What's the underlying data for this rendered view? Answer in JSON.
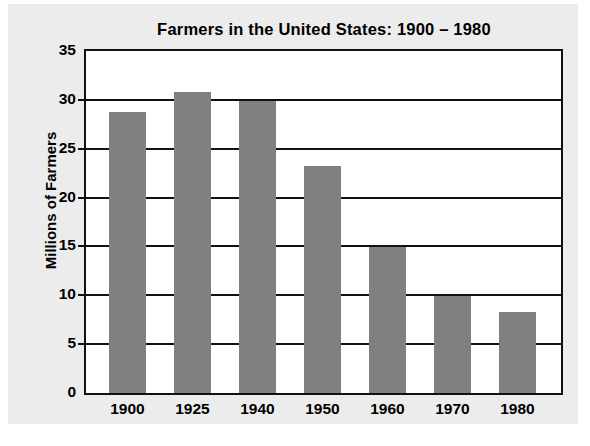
{
  "chart_data": {
    "type": "bar",
    "title": "Farmers in the United States: 1900 – 1980",
    "xlabel": "",
    "ylabel": "Millions of Farmers",
    "categories": [
      "1900",
      "1925",
      "1940",
      "1950",
      "1960",
      "1970",
      "1980"
    ],
    "values": [
      28.8,
      30.8,
      29.9,
      23.2,
      14.9,
      9.9,
      8.3
    ],
    "ylim": [
      0,
      35
    ],
    "ytick_labels": [
      "0",
      "5",
      "10",
      "15",
      "20",
      "25",
      "30",
      "35"
    ],
    "ytick_values": [
      0,
      5,
      10,
      15,
      20,
      25,
      30,
      35
    ],
    "grid": true,
    "legend": "none",
    "bar_color": "#808080",
    "plot_background": "#ffffff",
    "panel_background": "#ececec",
    "axis_color": "#111111"
  }
}
